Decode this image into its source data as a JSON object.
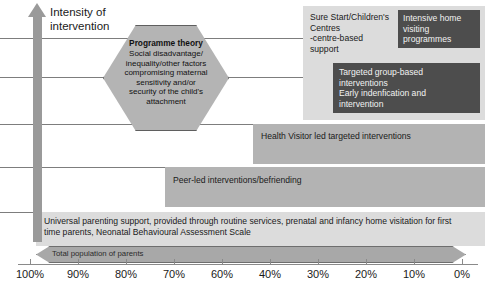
{
  "diagram": {
    "vertical_axis": {
      "label": "Intensity of\nintervention",
      "label_line1": "Intensity of",
      "label_line2": "intervention",
      "arrow_direction": "up"
    },
    "hexagon": {
      "title": "Programme theory",
      "body": "Social disadvantage/ inequality/other factors compromising maternal sensitivity and/or security of the child's attachment",
      "lines": [
        "Social disadvantage/",
        "inequality/other factors",
        "compromising maternal",
        "sensitivity and/or",
        "security of the child's",
        "attachment"
      ],
      "fill_color": "#b4b4b4",
      "border_color": "#5f5f5f"
    },
    "tiers": [
      {
        "id": "sure-start",
        "label": "Sure Start/Children's Centres -centre-based support",
        "lines": [
          "Sure Start/Children's",
          "Centres",
          "-centre-based",
          "support"
        ],
        "fill_color": "#dcdcdc",
        "text_color": "#1a1a1a"
      },
      {
        "id": "intensive-home-visiting",
        "label": "Intensive home visiting programmes",
        "lines": [
          "Intensive home",
          "visiting",
          "programmes"
        ],
        "fill_color": "#4d4d4d",
        "text_color": "#f2f2f2"
      },
      {
        "id": "targeted-group-based",
        "label": "Targeted group-based interventions Early indenfication and intervention",
        "lines": [
          "Targeted group-based",
          "interventions",
          "Early indenfication and",
          "intervention"
        ],
        "fill_color": "#4d4d4d",
        "text_color": "#f2f2f2"
      },
      {
        "id": "health-visitor",
        "label": "Health Visitor led targeted interventions",
        "lines": [
          "Health Visitor led targeted interventions"
        ],
        "fill_color": "#b3b3b3",
        "text_color": "#1a1a1a"
      },
      {
        "id": "peer-led",
        "label": "Peer-led interventions/befriending",
        "lines": [
          "Peer-led interventions/befriending"
        ],
        "fill_color": "#b3b3b3",
        "text_color": "#1a1a1a"
      },
      {
        "id": "universal-parenting",
        "label": "Universal parenting support, provided through routine services, prenatal and infancy home visitation for first time parents, Neonatal Behavioural Assessment Scale",
        "lines": [
          "Universal parenting support, provided through routine services, prenatal and infancy home visitation for first",
          "time parents, Neonatal Behavioural Assessment Scale"
        ],
        "fill_color": "#dcdcdc",
        "text_color": "#1a1a1a"
      }
    ],
    "population_bar": {
      "label": "Total population of parents",
      "fill_color": "#a8a8a8",
      "border_color": "#6e6e6e"
    },
    "axis": {
      "tick_labels": [
        "100%",
        "90%",
        "80%",
        "70%",
        "60%",
        "40%",
        "30%",
        "20%",
        "10%",
        "0%"
      ],
      "orientation": "horizontal",
      "direction": "descending"
    },
    "gridlines": {
      "count": 5,
      "color": "#7d7d7d"
    }
  }
}
